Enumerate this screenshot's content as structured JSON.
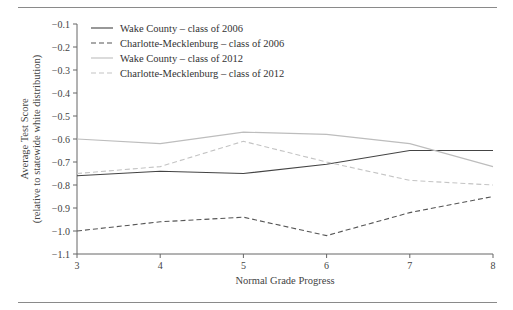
{
  "chart_data": {
    "type": "line",
    "title": "",
    "xlabel": "Normal Grade Progress",
    "ylabel": "Average Test Score",
    "ylabel_sub": "(relative to statewide white distribution)",
    "x": [
      3,
      4,
      5,
      6,
      7,
      8
    ],
    "xlim": [
      3,
      8
    ],
    "ylim": [
      -1.1,
      -0.1
    ],
    "x_ticks": [
      "3",
      "4",
      "5",
      "6",
      "7",
      "8"
    ],
    "y_ticks": [
      "−0.1",
      "−0.2",
      "−0.3",
      "−0.4",
      "−0.5",
      "−0.6",
      "−0.7",
      "−0.8",
      "−0.9",
      "−1.0",
      "−1.1"
    ],
    "y_tick_values": [
      -0.1,
      -0.2,
      -0.3,
      -0.4,
      -0.5,
      -0.6,
      -0.7,
      -0.8,
      -0.9,
      -1.0,
      -1.1
    ],
    "grid": false,
    "legend_position": "top-left",
    "series": [
      {
        "name": "Wake County – class of 2006",
        "color": "#444444",
        "dashed": false,
        "values": [
          -0.76,
          -0.74,
          -0.75,
          -0.71,
          -0.65,
          -0.65
        ]
      },
      {
        "name": "Charlotte-Mecklenburg – class of 2006",
        "color": "#555555",
        "dashed": true,
        "values": [
          -1.0,
          -0.96,
          -0.94,
          -1.02,
          -0.92,
          -0.85
        ]
      },
      {
        "name": "Wake County – class of 2012",
        "color": "#bdbdbd",
        "dashed": false,
        "values": [
          -0.6,
          -0.62,
          -0.57,
          -0.58,
          -0.62,
          -0.72
        ]
      },
      {
        "name": "Charlotte-Mecklenburg – class of 2012",
        "color": "#c4c4c4",
        "dashed": true,
        "values": [
          -0.75,
          -0.72,
          -0.61,
          -0.7,
          -0.78,
          -0.8
        ]
      }
    ]
  }
}
